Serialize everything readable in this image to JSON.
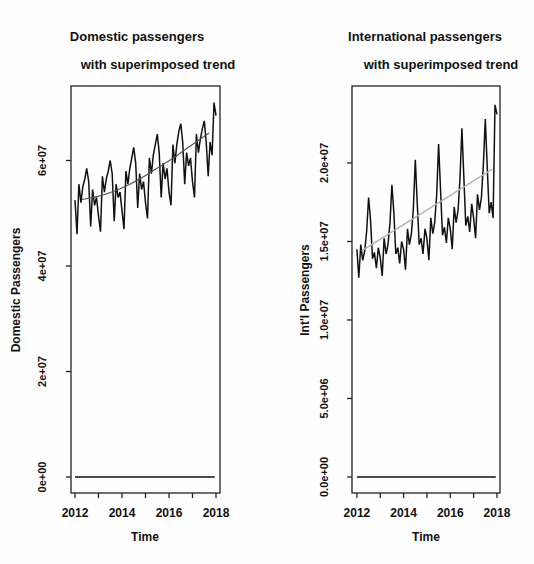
{
  "page": {
    "background": "#fefefe",
    "figure_type": "R base-graphics side-by-side time series plots"
  },
  "colors": {
    "ink": "#111111",
    "frame": "#222222",
    "domestic_trend": "#555555",
    "international_trend": "#b5b5b5"
  },
  "chart_data": [
    {
      "type": "line",
      "title_line1": "Domestic passengers",
      "title_line2": "with superimposed trend",
      "title": "Domestic passengers with superimposed trend",
      "xlabel": "Time",
      "ylabel": "Domestic Passengers",
      "grid": false,
      "legend": "none",
      "xlim": [
        2011.83,
        2018.17
      ],
      "ylim": [
        -3030000,
        74120000
      ],
      "x_ticks": [
        2012,
        2013,
        2014,
        2015,
        2016,
        2017,
        2018
      ],
      "x_tick_labels": [
        "2012",
        "",
        "2014",
        "",
        "2016",
        "",
        "2018"
      ],
      "y_ticks": [
        0,
        20000000.0,
        40000000.0,
        60000000.0
      ],
      "y_tick_labels": [
        "0e+00",
        "2e+07",
        "4e+07",
        "6e+07"
      ],
      "series": [
        {
          "name": "domestic-passengers-monthly",
          "color": "#111111",
          "width": 1.5,
          "x_start": 2012.0,
          "x_step": 0.0833333,
          "values": [
            52500000.0,
            46000000.0,
            55500000.0,
            52000000.0,
            55000000.0,
            56500000.0,
            58500000.0,
            56000000.0,
            47500000.0,
            54500000.0,
            51500000.0,
            53000000.0,
            49500000.0,
            46500000.0,
            57000000.0,
            54000000.0,
            56500000.0,
            58000000.0,
            60000000.0,
            57500000.0,
            48500000.0,
            55500000.0,
            53000000.0,
            54000000.0,
            50500000.0,
            47000000.0,
            58000000.0,
            55500000.0,
            58500000.0,
            60500000.0,
            62500000.0,
            59500000.0,
            51000000.0,
            57500000.0,
            54500000.0,
            56000000.0,
            52000000.0,
            49000000.0,
            60500000.0,
            57500000.0,
            61000000.0,
            63000000.0,
            65000000.0,
            61500000.0,
            53000000.0,
            59500000.0,
            56500000.0,
            58500000.0,
            54000000.0,
            51500000.0,
            63000000.0,
            59500000.0,
            63000000.0,
            65500000.0,
            67000000.0,
            63500000.0,
            55500000.0,
            61500000.0,
            59000000.0,
            60500000.0,
            56000000.0,
            53000000.0,
            65000000.0,
            61500000.0,
            64000000.0,
            66000000.0,
            67500000.0,
            63500000.0,
            57000000.0,
            63500000.0,
            61000000.0,
            71000000.0,
            68500000.0
          ]
        },
        {
          "name": "superimposed-trend",
          "color": "#555555",
          "width": 1.2,
          "x": [
            2012.3,
            2012.8,
            2013.3,
            2013.8,
            2014.3,
            2014.8,
            2015.3,
            2015.8,
            2016.3,
            2016.8,
            2017.3,
            2017.7
          ],
          "values": [
            52600000.0,
            53000000.0,
            53600000.0,
            54400000.0,
            55400000.0,
            56600000.0,
            58000000.0,
            59400000.0,
            60800000.0,
            62400000.0,
            64000000.0,
            65200000.0
          ]
        },
        {
          "name": "zero-baseline",
          "color": "#111111",
          "width": 1.5,
          "x": [
            2012.0,
            2017.95
          ],
          "values": [
            0,
            0
          ]
        }
      ]
    },
    {
      "type": "line",
      "title_line1": "International passengers",
      "title_line2": "with superimposed trend",
      "title": "International passengers with superimposed trend",
      "xlabel": "Time",
      "ylabel": "Int'l Passengers",
      "grid": false,
      "legend": "none",
      "xlim": [
        2011.79,
        2018.13
      ],
      "ylim": [
        -1020000,
        24900000
      ],
      "x_ticks": [
        2012,
        2013,
        2014,
        2015,
        2016,
        2017,
        2018
      ],
      "x_tick_labels": [
        "2012",
        "",
        "2014",
        "",
        "2016",
        "",
        "2018"
      ],
      "y_ticks": [
        0,
        5000000.0,
        10000000.0,
        15000000.0,
        20000000.0
      ],
      "y_tick_labels": [
        "0.0e+00",
        "5.0e+06",
        "1.0e+07",
        "1.5e+07",
        "2.0e+07"
      ],
      "series": [
        {
          "name": "international-passengers-monthly",
          "color": "#111111",
          "width": 1.5,
          "x_start": 2012.0,
          "x_step": 0.0833333,
          "values": [
            14500000.0,
            12700000.0,
            14800000.0,
            13800000.0,
            14400000.0,
            15600000.0,
            17800000.0,
            16400000.0,
            13900000.0,
            14300000.0,
            13300000.0,
            14600000.0,
            14000000.0,
            12800000.0,
            15200000.0,
            14200000.0,
            14800000.0,
            16200000.0,
            18600000.0,
            16800000.0,
            14200000.0,
            14600000.0,
            13600000.0,
            15000000.0,
            14500000.0,
            13200000.0,
            15800000.0,
            14800000.0,
            15500000.0,
            17000000.0,
            20200000.0,
            17500000.0,
            14800000.0,
            15200000.0,
            14200000.0,
            15800000.0,
            15200000.0,
            13800000.0,
            16500000.0,
            15500000.0,
            16200000.0,
            18000000.0,
            21200000.0,
            18200000.0,
            15400000.0,
            15900000.0,
            14900000.0,
            16500000.0,
            15800000.0,
            14500000.0,
            17200000.0,
            16200000.0,
            17000000.0,
            19000000.0,
            22200000.0,
            19000000.0,
            16000000.0,
            16600000.0,
            15600000.0,
            17400000.0,
            16500000.0,
            15200000.0,
            18000000.0,
            17000000.0,
            17800000.0,
            19800000.0,
            22800000.0,
            19800000.0,
            16800000.0,
            17500000.0,
            16500000.0,
            23700000.0,
            23100000.0
          ]
        },
        {
          "name": "superimposed-trend",
          "color": "#b5b5b5",
          "width": 1.5,
          "x": [
            2012.2,
            2017.8
          ],
          "values": [
            14400000.0,
            19600000.0
          ]
        },
        {
          "name": "zero-baseline",
          "color": "#111111",
          "width": 1.5,
          "x": [
            2012.0,
            2017.95
          ],
          "values": [
            0,
            0
          ]
        }
      ]
    }
  ]
}
